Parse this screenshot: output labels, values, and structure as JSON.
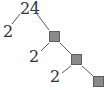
{
  "diagram": {
    "type": "factor-tree",
    "root": {
      "label": "24"
    },
    "nodes": [
      {
        "id": "root",
        "label": "24",
        "kind": "number"
      },
      {
        "id": "left1",
        "label": "2",
        "kind": "number",
        "parent": "root"
      },
      {
        "id": "box1",
        "label": "",
        "kind": "blank-box",
        "parent": "root"
      },
      {
        "id": "left2",
        "label": "2",
        "kind": "number",
        "parent": "box1"
      },
      {
        "id": "box2",
        "label": "",
        "kind": "blank-box",
        "parent": "box1"
      },
      {
        "id": "left3",
        "label": "2",
        "kind": "number",
        "parent": "box2"
      },
      {
        "id": "box3",
        "label": "",
        "kind": "blank-box",
        "parent": "box2"
      }
    ],
    "colors": {
      "text": "#333333",
      "line": "#5a5a5a",
      "box_fill": "#8a8a8a",
      "box_border": "#5e5e5e"
    }
  }
}
